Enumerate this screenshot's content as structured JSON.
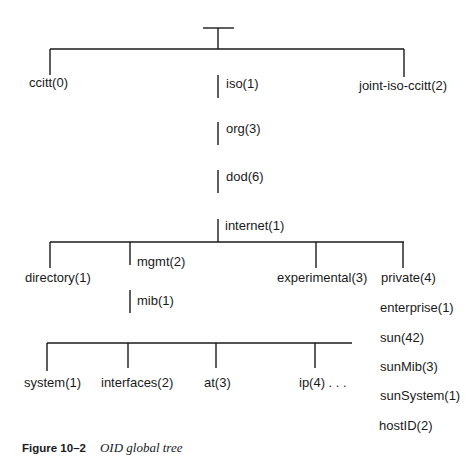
{
  "diagram": {
    "type": "tree",
    "nodes": {
      "ccitt": "ccitt(0)",
      "iso": "iso(1)",
      "joint": "joint-iso-ccitt(2)",
      "org": "org(3)",
      "dod": "dod(6)",
      "internet": "internet(1)",
      "directory": "directory(1)",
      "mgmt": "mgmt(2)",
      "experimental": "experimental(3)",
      "private": "private(4)",
      "mib": "mib(1)",
      "enterprise": "enterprise(1)",
      "sun": "sun(42)",
      "system": "system(1)",
      "interfaces": "interfaces(2)",
      "at": "at(3)",
      "ip": "ip(4) . . .",
      "sunMib": "sunMib(3)",
      "sunSystem": "sunSystem(1)",
      "hostID": "hostID(2)"
    },
    "edges": [
      [
        "root",
        "ccitt"
      ],
      [
        "root",
        "iso"
      ],
      [
        "root",
        "joint"
      ],
      [
        "iso",
        "org"
      ],
      [
        "org",
        "dod"
      ],
      [
        "dod",
        "internet"
      ],
      [
        "internet",
        "directory"
      ],
      [
        "internet",
        "mgmt"
      ],
      [
        "internet",
        "experimental"
      ],
      [
        "internet",
        "private"
      ],
      [
        "mgmt",
        "mib"
      ],
      [
        "mib",
        "system"
      ],
      [
        "mib",
        "interfaces"
      ],
      [
        "mib",
        "at"
      ],
      [
        "mib",
        "ip"
      ],
      [
        "private",
        "enterprise"
      ],
      [
        "enterprise",
        "sun"
      ],
      [
        "sun",
        "sunMib"
      ],
      [
        "sunMib",
        "sunSystem"
      ],
      [
        "sunSystem",
        "hostID"
      ]
    ]
  },
  "caption": {
    "figure": "Figure 10–2",
    "title": "OID global tree"
  }
}
